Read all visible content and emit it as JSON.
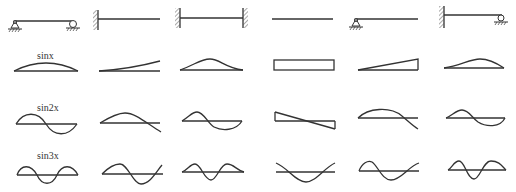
{
  "row_labels": {
    "row1": "sinx",
    "row2": "sin2x",
    "row3": "sin3x"
  },
  "columns": [
    {
      "id": "simply-supported",
      "support": "pin-roller"
    },
    {
      "id": "cantilever",
      "support": "fixed-free"
    },
    {
      "id": "fixed-fixed",
      "support": "fixed-fixed"
    },
    {
      "id": "free-free",
      "support": "free-free"
    },
    {
      "id": "pin-free",
      "support": "pin-free"
    },
    {
      "id": "fixed-roller",
      "support": "fixed-roller"
    }
  ],
  "colors": {
    "line": "#333333",
    "hatch": "#555555"
  }
}
